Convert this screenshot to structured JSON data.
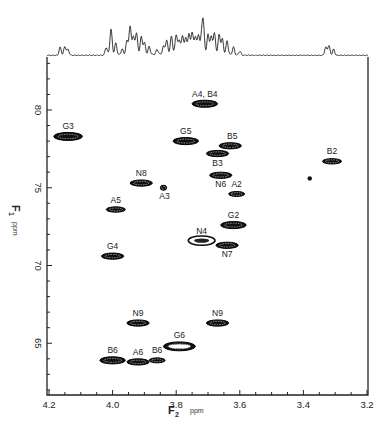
{
  "chart_data": {
    "type": "heatmap",
    "subtype": "2D NMR contour spectrum (HSQC/HMQC-like) with 1D projection",
    "title": "",
    "xlabel": "F2",
    "xlabel_unit": "ppm",
    "ylabel": "F1",
    "ylabel_unit": "ppm",
    "xlim": [
      4.2,
      3.2
    ],
    "ylim": [
      83,
      61.5
    ],
    "x_reversed": true,
    "y_reversed": true,
    "x_ticks": [
      "4.2",
      "4.0",
      "3.8",
      "3.6",
      "3.4",
      "3.2"
    ],
    "y_ticks": [
      "80",
      "75",
      "70",
      "65"
    ],
    "grid": false,
    "legend": null,
    "projection": {
      "axis": "F2",
      "position": "top",
      "description": "1D proton spectrum; small multiplet ~4.16 ppm, dense peaks 4.02-3.58 ppm, small multiplet ~3.32 ppm"
    },
    "peaks": [
      {
        "label": "A4, B4",
        "f2": 3.71,
        "f1": 80.4,
        "width": 0.08
      },
      {
        "label": "G3",
        "f2": 4.14,
        "f1": 78.3,
        "width": 0.09
      },
      {
        "label": "G5",
        "f2": 3.77,
        "f1": 78.0,
        "width": 0.08
      },
      {
        "label": "B5",
        "f2": 3.63,
        "f1": 77.7,
        "width": 0.07
      },
      {
        "label": "B3",
        "f2": 3.67,
        "f1": 77.2,
        "width": 0.07
      },
      {
        "label": "B2",
        "f2": 3.31,
        "f1": 76.7,
        "width": 0.06
      },
      {
        "label": "N6",
        "f2": 3.66,
        "f1": 75.8,
        "width": 0.07
      },
      {
        "label": "N8",
        "f2": 3.91,
        "f1": 75.3,
        "width": 0.07
      },
      {
        "label": "A3",
        "f2": 3.84,
        "f1": 75.0,
        "width": 0.02
      },
      {
        "label": "A2",
        "f2": 3.61,
        "f1": 74.6,
        "width": 0.05
      },
      {
        "label": "A5",
        "f2": 3.99,
        "f1": 73.6,
        "width": 0.06
      },
      {
        "label": "G2",
        "f2": 3.62,
        "f1": 72.6,
        "width": 0.08
      },
      {
        "label": "N4",
        "f2": 3.72,
        "f1": 71.6,
        "width": 0.08
      },
      {
        "label": "N7",
        "f2": 3.64,
        "f1": 71.3,
        "width": 0.07
      },
      {
        "label": "G4",
        "f2": 4.0,
        "f1": 70.6,
        "width": 0.07
      },
      {
        "label": "N9",
        "f2": 3.92,
        "f1": 66.3,
        "width": 0.07
      },
      {
        "label": "N9",
        "f2": 3.67,
        "f1": 66.3,
        "width": 0.07
      },
      {
        "label": "G6",
        "f2": 3.79,
        "f1": 64.8,
        "width": 0.1
      },
      {
        "label": "B6",
        "f2": 4.0,
        "f1": 63.9,
        "width": 0.08
      },
      {
        "label": "A6",
        "f2": 3.92,
        "f1": 63.8,
        "width": 0.07
      },
      {
        "label": "B6",
        "f2": 3.86,
        "f1": 63.9,
        "width": 0.05
      }
    ],
    "artifact": {
      "f2": 3.38,
      "f1": 75.6,
      "label": ""
    }
  },
  "axes": {
    "x_label_main": "F",
    "x_label_sub": "2",
    "x_unit": "ppm",
    "y_label_main": "F",
    "y_label_sub": "1",
    "y_unit": "ppm"
  }
}
